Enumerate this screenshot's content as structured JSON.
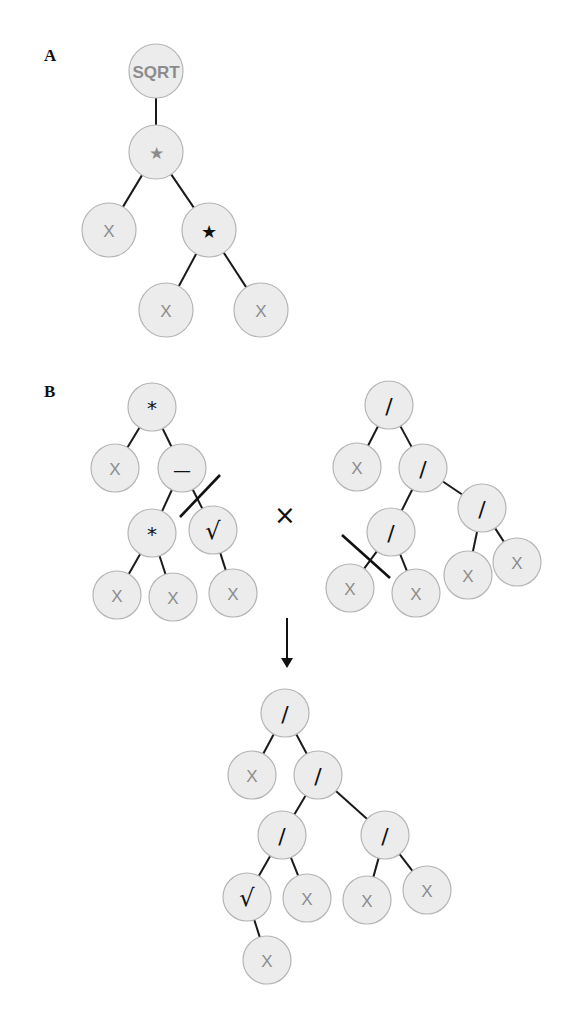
{
  "panels": {
    "a": {
      "label": "A"
    },
    "b": {
      "label": "B"
    }
  },
  "colors": {
    "node_fill": "#ececec",
    "node_stroke": "#b5b5b5",
    "edge": "#1a1a1a",
    "terminal_text": "#8c8c8c",
    "operator_text": "#111111"
  },
  "tree_a": {
    "nodes": [
      {
        "id": "a0",
        "label": "SQRT",
        "x": 156,
        "y": 71,
        "r": 27,
        "style": "gray",
        "size": 15
      },
      {
        "id": "a1",
        "label": "★",
        "x": 156,
        "y": 152,
        "r": 27,
        "style": "gray",
        "size": 18
      },
      {
        "id": "a2",
        "label": "X",
        "x": 109,
        "y": 230,
        "r": 27,
        "style": "gray",
        "size": 17
      },
      {
        "id": "a3",
        "label": "★",
        "x": 209,
        "y": 230,
        "r": 27,
        "style": "dark",
        "size": 18
      },
      {
        "id": "a4",
        "label": "X",
        "x": 166,
        "y": 310,
        "r": 27,
        "style": "gray",
        "size": 17
      },
      {
        "id": "a5",
        "label": "X",
        "x": 261,
        "y": 310,
        "r": 27,
        "style": "gray",
        "size": 17
      }
    ],
    "edges": [
      [
        "a0",
        "a1"
      ],
      [
        "a1",
        "a2"
      ],
      [
        "a1",
        "a3"
      ],
      [
        "a3",
        "a4"
      ],
      [
        "a3",
        "a5"
      ]
    ]
  },
  "tree_b_parent1": {
    "nodes": [
      {
        "id": "p0",
        "label": "*",
        "x": 152,
        "y": 407,
        "r": 24,
        "style": "dark",
        "size": 20
      },
      {
        "id": "p1",
        "label": "X",
        "x": 115,
        "y": 468,
        "r": 24,
        "style": "gray",
        "size": 17
      },
      {
        "id": "p2",
        "label": "—",
        "x": 182,
        "y": 468,
        "r": 24,
        "style": "dark",
        "size": 18
      },
      {
        "id": "p3",
        "label": "*",
        "x": 152,
        "y": 533,
        "r": 24,
        "style": "dark",
        "size": 20
      },
      {
        "id": "p4",
        "label": "√",
        "x": 213,
        "y": 530,
        "r": 24,
        "style": "dark",
        "size": 24
      },
      {
        "id": "p5",
        "label": "X",
        "x": 117,
        "y": 595,
        "r": 24,
        "style": "gray",
        "size": 17
      },
      {
        "id": "p6",
        "label": "X",
        "x": 173,
        "y": 597,
        "r": 24,
        "style": "gray",
        "size": 17
      },
      {
        "id": "p7",
        "label": "X",
        "x": 233,
        "y": 593,
        "r": 24,
        "style": "gray",
        "size": 17
      }
    ],
    "edges": [
      [
        "p0",
        "p1"
      ],
      [
        "p0",
        "p2"
      ],
      [
        "p2",
        "p3"
      ],
      [
        "p2",
        "p4"
      ],
      [
        "p3",
        "p5"
      ],
      [
        "p3",
        "p6"
      ],
      [
        "p4",
        "p7"
      ]
    ],
    "cut": {
      "x1": 180,
      "y1": 517,
      "x2": 220,
      "y2": 475
    }
  },
  "crossover_symbol": {
    "label": "×",
    "x": 285,
    "y": 515
  },
  "tree_b_parent2": {
    "nodes": [
      {
        "id": "q0",
        "label": "/",
        "x": 389,
        "y": 405,
        "r": 24,
        "style": "dark",
        "size": 22
      },
      {
        "id": "q1",
        "label": "X",
        "x": 357,
        "y": 467,
        "r": 24,
        "style": "gray",
        "size": 17
      },
      {
        "id": "q2",
        "label": "/",
        "x": 423,
        "y": 468,
        "r": 24,
        "style": "dark",
        "size": 22
      },
      {
        "id": "q3",
        "label": "/",
        "x": 482,
        "y": 508,
        "r": 24,
        "style": "dark",
        "size": 22
      },
      {
        "id": "q4",
        "label": "/",
        "x": 391,
        "y": 532,
        "r": 24,
        "style": "dark",
        "size": 22
      },
      {
        "id": "q5",
        "label": "X",
        "x": 350,
        "y": 588,
        "r": 24,
        "style": "gray",
        "size": 17
      },
      {
        "id": "q6",
        "label": "X",
        "x": 416,
        "y": 593,
        "r": 24,
        "style": "gray",
        "size": 17
      },
      {
        "id": "q7",
        "label": "X",
        "x": 468,
        "y": 575,
        "r": 24,
        "style": "gray",
        "size": 17
      },
      {
        "id": "q8",
        "label": "X",
        "x": 517,
        "y": 562,
        "r": 24,
        "style": "gray",
        "size": 17
      }
    ],
    "edges": [
      [
        "q0",
        "q1"
      ],
      [
        "q0",
        "q2"
      ],
      [
        "q2",
        "q4"
      ],
      [
        "q2",
        "q3"
      ],
      [
        "q4",
        "q5"
      ],
      [
        "q4",
        "q6"
      ],
      [
        "q3",
        "q7"
      ],
      [
        "q3",
        "q8"
      ]
    ],
    "cut": {
      "x1": 342,
      "y1": 535,
      "x2": 390,
      "y2": 578
    }
  },
  "arrow": {
    "x": 287,
    "y1": 618,
    "y2": 668
  },
  "tree_b_offspring": {
    "nodes": [
      {
        "id": "o0",
        "label": "/",
        "x": 285,
        "y": 713,
        "r": 24,
        "style": "dark",
        "size": 22
      },
      {
        "id": "o1",
        "label": "X",
        "x": 252,
        "y": 775,
        "r": 24,
        "style": "gray",
        "size": 17
      },
      {
        "id": "o2",
        "label": "/",
        "x": 318,
        "y": 775,
        "r": 24,
        "style": "dark",
        "size": 22
      },
      {
        "id": "o3",
        "label": "/",
        "x": 282,
        "y": 835,
        "r": 24,
        "style": "dark",
        "size": 22
      },
      {
        "id": "o4",
        "label": "/",
        "x": 385,
        "y": 835,
        "r": 24,
        "style": "dark",
        "size": 22
      },
      {
        "id": "o5",
        "label": "√",
        "x": 247,
        "y": 897,
        "r": 24,
        "style": "dark",
        "size": 24
      },
      {
        "id": "o6",
        "label": "X",
        "x": 307,
        "y": 898,
        "r": 24,
        "style": "gray",
        "size": 17
      },
      {
        "id": "o7",
        "label": "X",
        "x": 367,
        "y": 900,
        "r": 24,
        "style": "gray",
        "size": 17
      },
      {
        "id": "o8",
        "label": "X",
        "x": 427,
        "y": 890,
        "r": 24,
        "style": "gray",
        "size": 17
      },
      {
        "id": "o9",
        "label": "X",
        "x": 267,
        "y": 960,
        "r": 24,
        "style": "gray",
        "size": 17
      }
    ],
    "edges": [
      [
        "o0",
        "o1"
      ],
      [
        "o0",
        "o2"
      ],
      [
        "o2",
        "o3"
      ],
      [
        "o2",
        "o4"
      ],
      [
        "o3",
        "o5"
      ],
      [
        "o3",
        "o6"
      ],
      [
        "o4",
        "o7"
      ],
      [
        "o4",
        "o8"
      ],
      [
        "o5",
        "o9"
      ]
    ]
  }
}
